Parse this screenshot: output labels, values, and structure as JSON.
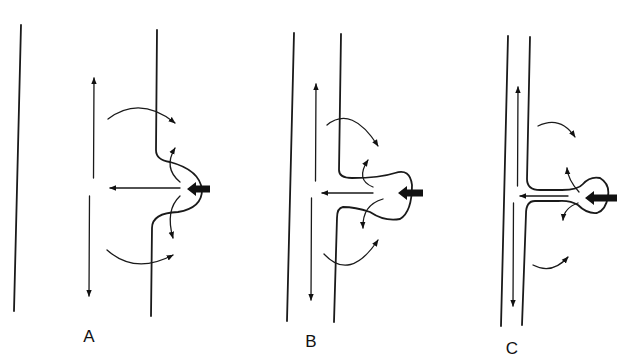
{
  "figure": {
    "panels": [
      {
        "id": "A",
        "label": "A",
        "label_pos": [
          89,
          342
        ],
        "walls": [
          "M21 25 L14 311",
          "M157 30 L156 150 Q156 160 170 162 Q200 170 202 190 Q202 208 178 212 Q152 213 152 228 L151 316"
        ],
        "vertical_arrow": {
          "x1": 94,
          "y_top": 78,
          "y_gap_top": 178,
          "y_gap_bot": 196,
          "x2": 89,
          "y_bot": 296
        },
        "horizontal_arrow": {
          "x_from": 180,
          "x_to": 110,
          "y": 188
        },
        "thick_arrow": {
          "x_tip": 187,
          "x_tail": 210,
          "y": 189
        },
        "curved_arrows": [
          "M108 119 Q140 95 175 123",
          "M180 182 Q163 168 175 148",
          "M180 196 Q165 210 173 238",
          "M107 250 Q135 275 173 255"
        ]
      },
      {
        "id": "B",
        "label": "B",
        "label_pos": [
          311,
          347
        ],
        "walls": [
          "M294 33 L287 321",
          "M341 34 L339 170 Q339 178 352 178 Q380 178 395 173 Q410 168 412 185 Q412 212 400 219 Q385 222 370 212 Q355 207 343 207 Q337 208 337 218 L334 322"
        ],
        "vertical_arrow": {
          "x1": 316,
          "y_top": 84,
          "y_gap_top": 181,
          "y_gap_bot": 198,
          "x2": 311,
          "y_bot": 300
        },
        "horizontal_arrow": {
          "x_from": 373,
          "x_to": 322,
          "y": 193
        },
        "thick_arrow": {
          "x_tip": 398,
          "x_tail": 423,
          "y": 193
        },
        "curved_arrows": [
          "M327 125 Q352 105 378 146",
          "M373 187 Q355 180 368 160",
          "M383 199 Q362 205 363 228",
          "M324 254 Q350 282 378 240"
        ]
      },
      {
        "id": "C",
        "label": "C",
        "label_pos": [
          512,
          354
        ],
        "walls": [
          "M508 36 L501 326",
          "M530 37 L527 179 Q527 190 540 190 L562 190 Q578 190 583 184 Q590 176 600 178 Q610 184 608 196 Q606 210 597 213 Q587 214 578 205 Q570 200 558 201 L535 201 Q526 201 526 214 L522 325"
        ],
        "inner_lines": [
          "M516 186 L516 100",
          "M516 203 L513 296"
        ],
        "vertical_arrow": {
          "x1": 518,
          "y_top": 87,
          "y_gap_top": 186,
          "y_gap_bot": 203,
          "x2": 513,
          "y_bot": 306
        },
        "horizontal_arrow": {
          "x_from": 568,
          "x_to": 520,
          "y": 196
        },
        "thick_arrow": {
          "x_tip": 585,
          "x_tail": 617,
          "y": 198
        },
        "curved_arrows": [
          "M538 126 Q560 115 575 137",
          "M579 192 Q568 180 567 168",
          "M578 203 Q564 208 563 220",
          "M533 265 Q552 275 568 257"
        ]
      }
    ]
  }
}
